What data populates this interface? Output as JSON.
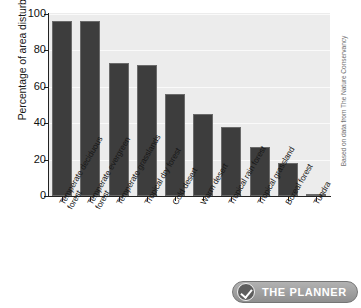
{
  "chart_data": {
    "type": "bar",
    "title": "",
    "xlabel": "",
    "ylabel": "Percentage of area disturbed",
    "ylim": [
      0,
      100
    ],
    "yticks": [
      0,
      20,
      40,
      60,
      80,
      100
    ],
    "grid": true,
    "legend": null,
    "categories": [
      "Temperate deciduous forest",
      "Temperate evergreen forest",
      "Temperate grasslands",
      "Tropical dry forest",
      "Cold desert",
      "Warm desert",
      "Tropical rain forest",
      "Tropical grassland",
      "Boreal forest",
      "Tundra"
    ],
    "category_lines": [
      [
        "Temperate deciduous",
        "forest"
      ],
      [
        "Temperate evergreen",
        "forest"
      ],
      [
        "Temperate grasslands",
        ""
      ],
      [
        "Tropical dry forest",
        ""
      ],
      [
        "Cold desert",
        ""
      ],
      [
        "Warm desert",
        ""
      ],
      [
        "Tropical rain forest",
        ""
      ],
      [
        "Tropical grassland",
        ""
      ],
      [
        "Boreal forest",
        ""
      ],
      [
        "Tundra",
        ""
      ]
    ],
    "values": [
      96,
      96,
      73,
      72,
      56,
      45,
      38,
      27,
      18,
      1
    ],
    "bar_color": "#3d3d3d",
    "plot_background": "#ececec"
  },
  "annotations": {
    "source_credit": "Based on data from The Nature Conservancy"
  },
  "badge": {
    "label": "THE PLANNER",
    "icon": "check-icon"
  }
}
